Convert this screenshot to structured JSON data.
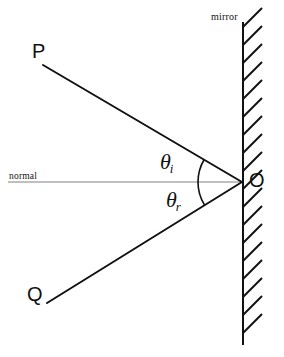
{
  "figure": {
    "type": "optics-reflection-diagram",
    "width": 284,
    "height": 357,
    "background_color": "#ffffff"
  },
  "labels": {
    "mirror": "mirror",
    "normal": "normal",
    "point_p": "P",
    "point_q": "Q",
    "point_o": "O",
    "theta_incident_symbol": "θ",
    "theta_incident_subscript": "i",
    "theta_reflected_symbol": "θ",
    "theta_reflected_subscript": "r"
  },
  "colors": {
    "ray_stroke": "#111111",
    "mirror_stroke": "#111111",
    "hatch_stroke": "#111111",
    "normal_stroke": "#808080",
    "arc_stroke": "#111111",
    "text": "#111111"
  },
  "geometry": {
    "origin_point": {
      "x": 242,
      "y": 182
    },
    "mirror_line": {
      "x": 243,
      "y_top": 22,
      "y_bottom": 345,
      "stroke_width": 2
    },
    "hatch": {
      "count": 18,
      "y_start": 27,
      "spacing": 18,
      "dx": 19,
      "dy": -19,
      "stroke_width": 2
    },
    "incident_ray": {
      "x1": 43,
      "y1": 65,
      "x2": 242,
      "y2": 182,
      "stroke_width": 2
    },
    "reflected_ray": {
      "x1": 242,
      "y1": 182,
      "x2": 47,
      "y2": 303,
      "stroke_width": 2
    },
    "normal_line": {
      "x1": 8,
      "y1": 182,
      "x2": 244,
      "y2": 182,
      "stroke_width": 1
    },
    "arc_incident": {
      "cx": 242,
      "cy": 182,
      "radius": 44,
      "start_deg": 180,
      "end_deg": 210.4
    },
    "arc_reflected": {
      "cx": 242,
      "cy": 182,
      "radius": 44,
      "start_deg": 148.2,
      "end_deg": 180
    }
  },
  "angles": {
    "angle_of_incidence_deg": 30.4,
    "angle_of_reflection_deg": 31.8
  },
  "label_positions": {
    "mirror": {
      "left": 211,
      "top": 12
    },
    "normal": {
      "left": 9,
      "top": 172
    },
    "point_p": {
      "left": 32,
      "top": 41
    },
    "point_q": {
      "left": 27,
      "top": 284
    },
    "point_o": {
      "left": 249,
      "top": 170
    },
    "theta_incident": {
      "left": 160,
      "top": 151
    },
    "theta_reflected": {
      "left": 166,
      "top": 189
    }
  }
}
